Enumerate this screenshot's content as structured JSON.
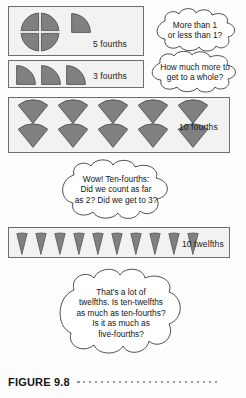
{
  "figure": {
    "caption_label": "FIGURE 9.8",
    "dot_count": 24,
    "dot_color": "#7c7c7c"
  },
  "colors": {
    "shape_fill": "#808080",
    "shape_stroke": "#4a4a4a",
    "box_border": "#6d6d6d",
    "box_fill": "#f2f2f2",
    "page_background": "#fdfdfd",
    "text": "#161616",
    "bubble_outline": "#3a3a3a"
  },
  "models": [
    {
      "id": "five-fourths",
      "label": "5 fourths",
      "unit": "fourth",
      "count": 5,
      "arrangement": "one-whole-circle-plus-one-quarter",
      "wholes": 1,
      "extra_parts": 1
    },
    {
      "id": "three-fourths",
      "label": "3 fourths",
      "unit": "fourth",
      "count": 3,
      "arrangement": "three-separate-quarter-circles",
      "wholes": 0,
      "extra_parts": 3
    },
    {
      "id": "ten-fourths",
      "label": "10 fourths",
      "unit": "fourth",
      "count": 10,
      "arrangement": "two-rows-of-five-wedges",
      "rows": 2,
      "per_row": 5
    },
    {
      "id": "ten-twelfths",
      "label": "10 twelfths",
      "unit": "twelfth",
      "count": 10,
      "arrangement": "single-row-of-ten-narrow-wedges",
      "rows": 1,
      "per_row": 10
    }
  ],
  "bubbles": [
    {
      "id": "more-or-less-than-1",
      "lines": [
        "More than 1",
        "or less than 1?"
      ]
    },
    {
      "id": "how-much-more-to-whole",
      "lines": [
        "How much more to",
        "get to a whole?"
      ]
    },
    {
      "id": "wow-ten-fourths",
      "lines": [
        "Wow! Ten-fourths:",
        "Did we count as far",
        "as 2? Did we get to 3?"
      ]
    },
    {
      "id": "lot-of-twelfths",
      "lines": [
        "That's a lot of",
        "twelfths. Is ten-twelfths",
        "as much as ten-fourths?",
        "Is it as much as",
        "five-fourths?"
      ]
    }
  ]
}
